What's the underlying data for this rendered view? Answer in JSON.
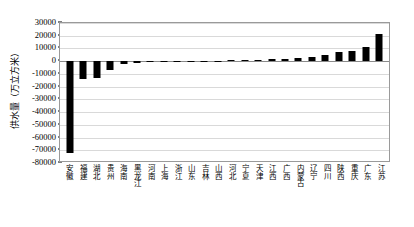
{
  "chart_data": {
    "type": "bar",
    "title": "",
    "xlabel": "",
    "ylabel": "供水量（万立方米）",
    "ylim": [
      -80000,
      30000
    ],
    "ytick_step": 10000,
    "yticks": [
      30000,
      20000,
      10000,
      0,
      -10000,
      -20000,
      -30000,
      -40000,
      -50000,
      -60000,
      -70000,
      -80000
    ],
    "ytick_labels": [
      "30000",
      "20000",
      "10000",
      "0",
      "-10000",
      "-20000",
      "-30000",
      "-40000",
      "-50000",
      "-60000",
      "-70000",
      "-80000"
    ],
    "grid": true,
    "legend": null,
    "bar_color": "#000000",
    "categories": [
      "安徽",
      "福建",
      "湖北",
      "贵州",
      "海南",
      "黑龙江",
      "河南",
      "上海",
      "浙江",
      "山东",
      "吉林",
      "山西",
      "河北",
      "宁夏",
      "天津",
      "江西",
      "广西",
      "内蒙古",
      "辽宁",
      "四川",
      "陕西",
      "重庆",
      "广东",
      "江苏"
    ],
    "values": [
      -72000,
      -14000,
      -13500,
      -7000,
      -2200,
      -1500,
      -900,
      -600,
      -300,
      -200,
      200,
      400,
      700,
      900,
      1100,
      1400,
      1800,
      2600,
      3600,
      5200,
      7600,
      8000,
      11500,
      21000
    ]
  }
}
